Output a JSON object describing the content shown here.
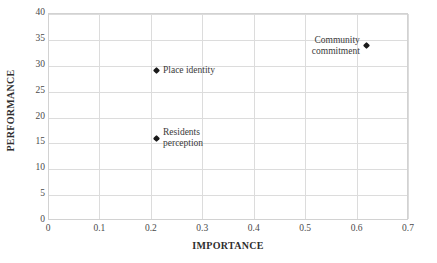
{
  "chart_data": {
    "type": "scatter",
    "title": "",
    "xlabel": "IMPORTANCE",
    "ylabel": "PERFORMANCE",
    "xlim": [
      0,
      0.7
    ],
    "ylim": [
      0,
      40
    ],
    "xticks": [
      "0",
      "0.1",
      "0.2",
      "0.3",
      "0.4",
      "0.5",
      "0.6",
      "0.7"
    ],
    "xtick_values": [
      0,
      0.1,
      0.2,
      0.3,
      0.4,
      0.5,
      0.6,
      0.7
    ],
    "yticks": [
      "0",
      "5",
      "10",
      "15",
      "20",
      "25",
      "30",
      "35",
      "40"
    ],
    "ytick_values": [
      0,
      5,
      10,
      15,
      20,
      25,
      30,
      35,
      40
    ],
    "grid": true,
    "legend": "none",
    "marker_color": "#1a1a1a",
    "grid_color": "#dcdcdc",
    "points": [
      {
        "label": "Place identity",
        "x": 0.21,
        "y": 28.9,
        "label_position": "right"
      },
      {
        "label": "Residents\nperception",
        "x": 0.21,
        "y": 15.8,
        "label_position": "right"
      },
      {
        "label": "Community\ncommitment",
        "x": 0.62,
        "y": 33.7,
        "label_position": "left"
      }
    ]
  }
}
